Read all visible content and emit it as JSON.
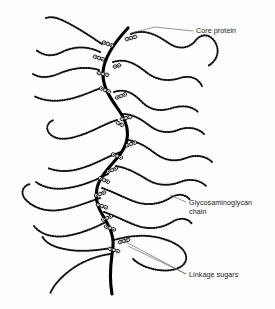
{
  "figure": {
    "background_color": "#fefefe",
    "ink_color": "#000000",
    "leader_color": "#666666",
    "width": 275,
    "height": 309
  },
  "labels": [
    {
      "id": "core-protein",
      "lines": [
        "Core protein"
      ],
      "text_x": 196,
      "text_y": 33,
      "leader": "M 193 31 L 155 27 L 131 33"
    },
    {
      "id": "glycosaminoglycan-chain",
      "lines": [
        "Glycosaminoglycan",
        "chain"
      ],
      "text_x": 189,
      "text_y": 205,
      "leader": "M 186 202 L 170 195"
    },
    {
      "id": "linkage-sugars",
      "lines": [
        "Linkage sugars"
      ],
      "text_x": 189,
      "text_y": 277,
      "leader_a": "M 186 274 L 128 246",
      "leader_b": "M 186 274 L 124 241"
    }
  ],
  "core_protein": {
    "name": "core-protein",
    "path": "M 128 28 C 113 44, 104 58, 103 72 C 102 88, 112 100, 120 112 C 128 124, 130 136, 124 148 C 118 160, 106 168, 100 180 C 94 192, 96 204, 102 214 C 108 224, 114 234, 113 246 C 112 258, 108 272, 112 294",
    "stroke_width": 3.1
  },
  "gag_chains": [
    {
      "id": "chain-r1",
      "side": "right",
      "path": "M 131 34 C 146 28, 158 36, 170 44 C 180 50, 190 48, 196 40 C 202 33, 210 34, 215 42 C 220 50, 218 60, 208 66"
    },
    {
      "id": "chain-l1",
      "side": "left",
      "path": "M 102 44 C 90 36, 78 28, 66 22 C 58 18, 52 16, 46 18"
    },
    {
      "id": "chain-l2",
      "side": "left",
      "path": "M 100 52 C 88 46, 74 46, 62 52 C 52 57, 44 56, 36 50"
    },
    {
      "id": "chain-r2",
      "side": "right",
      "path": "M 113 62 C 126 58, 136 64, 146 72 C 156 80, 168 82, 180 78 C 190 75, 198 78, 202 86"
    },
    {
      "id": "chain-l3",
      "side": "left",
      "path": "M 99 70 C 86 66, 72 68, 58 74 C 48 78, 40 78, 33 74"
    },
    {
      "id": "chain-l4",
      "side": "left",
      "path": "M 101 88 C 90 92, 78 98, 64 100 C 52 102, 42 100, 34 96"
    },
    {
      "id": "chain-r3",
      "side": "right",
      "path": "M 114 92 C 126 88, 134 94, 142 102 C 150 110, 160 112, 172 108 C 182 105, 192 106, 198 112"
    },
    {
      "id": "chain-r4",
      "side": "right",
      "path": "M 122 114 C 134 114, 142 120, 150 126 C 158 132, 168 134, 178 130 C 188 126, 198 128, 204 134"
    },
    {
      "id": "chain-l5",
      "side": "left",
      "path": "M 117 120 C 104 124, 92 132, 78 136 C 66 140, 56 140, 50 134 C 45 129, 47 122, 54 120"
    },
    {
      "id": "chain-r5",
      "side": "right",
      "path": "M 128 140 C 140 142, 148 148, 156 154 C 166 161, 176 162, 186 158 C 196 154, 206 156, 212 162"
    },
    {
      "id": "chain-l6",
      "side": "left",
      "path": "M 121 152 C 108 156, 96 164, 82 168 C 70 172, 58 172, 48 168"
    },
    {
      "id": "chain-r6",
      "side": "right",
      "path": "M 116 166 C 128 168, 138 174, 148 180 C 158 186, 170 186, 180 182 C 190 178, 200 180, 206 186"
    },
    {
      "id": "chain-l7",
      "side": "left",
      "path": "M 108 174 C 96 180, 82 186, 68 188 C 56 190, 44 188, 36 182"
    },
    {
      "id": "chain-r7",
      "side": "right",
      "path": "M 102 188 C 114 192, 124 198, 136 202 C 148 206, 160 204, 170 198 C 178 193, 186 194, 190 200"
    },
    {
      "id": "chain-l8",
      "side": "left",
      "path": "M 100 198 C 88 202, 74 208, 60 210 C 46 212, 34 208, 26 200 C 20 194, 22 186, 30 184"
    },
    {
      "id": "chain-r8",
      "side": "right",
      "path": "M 104 212 C 116 216, 126 222, 138 226 C 150 230, 162 228, 172 222 C 180 217, 188 218, 192 224"
    },
    {
      "id": "chain-l9",
      "side": "left",
      "path": "M 106 222 C 94 228, 80 234, 66 236 C 52 238, 40 234, 34 226"
    },
    {
      "id": "chain-r9",
      "side": "right",
      "path": "M 114 240 C 128 236, 144 234, 160 238 C 176 242, 188 250, 186 260 C 184 268, 172 272, 158 270 C 146 268, 138 264, 132 258"
    },
    {
      "id": "chain-l10",
      "side": "left",
      "path": "M 112 248 C 98 250, 84 252, 70 250 C 56 248, 46 244, 42 236"
    },
    {
      "id": "chain-l11",
      "side": "left",
      "path": "M 110 254 C 96 256, 80 262, 68 272 C 58 280, 52 288, 50 294"
    }
  ],
  "linkage_sugar_clusters": [
    {
      "id": "ls-1",
      "x": 108,
      "y": 44,
      "angle": 20,
      "count": 3
    },
    {
      "id": "ls-2",
      "x": 131,
      "y": 38,
      "angle": -15,
      "count": 3
    },
    {
      "id": "ls-3",
      "x": 99,
      "y": 58,
      "angle": 18,
      "count": 3
    },
    {
      "id": "ls-4",
      "x": 103,
      "y": 74,
      "angle": 12,
      "count": 3
    },
    {
      "id": "ls-5",
      "x": 117,
      "y": 66,
      "angle": -18,
      "count": 2
    },
    {
      "id": "ls-6",
      "x": 105,
      "y": 90,
      "angle": 22,
      "count": 3
    },
    {
      "id": "ls-7",
      "x": 121,
      "y": 96,
      "angle": -22,
      "count": 3
    },
    {
      "id": "ls-8",
      "x": 126,
      "y": 118,
      "angle": -12,
      "count": 3
    },
    {
      "id": "ls-9",
      "x": 120,
      "y": 124,
      "angle": 26,
      "count": 2
    },
    {
      "id": "ls-10",
      "x": 131,
      "y": 144,
      "angle": -20,
      "count": 3
    },
    {
      "id": "ls-11",
      "x": 117,
      "y": 156,
      "angle": 22,
      "count": 3
    },
    {
      "id": "ls-12",
      "x": 112,
      "y": 170,
      "angle": -22,
      "count": 3
    },
    {
      "id": "ls-13",
      "x": 104,
      "y": 180,
      "angle": 24,
      "count": 3
    },
    {
      "id": "ls-14",
      "x": 100,
      "y": 194,
      "angle": -20,
      "count": 3
    },
    {
      "id": "ls-15",
      "x": 102,
      "y": 206,
      "angle": 18,
      "count": 3
    },
    {
      "id": "ls-16",
      "x": 107,
      "y": 218,
      "angle": -22,
      "count": 3
    },
    {
      "id": "ls-17",
      "x": 110,
      "y": 228,
      "angle": 20,
      "count": 3
    },
    {
      "id": "ls-18",
      "x": 124,
      "y": 241,
      "angle": -16,
      "count": 3
    },
    {
      "id": "ls-19",
      "x": 114,
      "y": 250,
      "angle": 16,
      "count": 3
    }
  ]
}
